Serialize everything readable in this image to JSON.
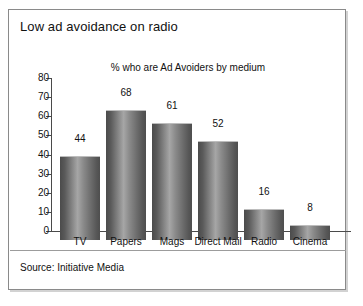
{
  "chart_data": {
    "type": "bar",
    "title": "Low ad avoidance on radio",
    "subtitle": "% who are Ad Avoiders by medium",
    "categories": [
      "TV",
      "Papers",
      "Mags",
      "Direct Mail",
      "Radio",
      "Cinema"
    ],
    "values": [
      44,
      68,
      61,
      52,
      16,
      8
    ],
    "xlabel": "",
    "ylabel": "",
    "ylim": [
      0,
      80
    ],
    "ytick_step": 10,
    "yticks": [
      0,
      10,
      20,
      30,
      40,
      50,
      60,
      70,
      80
    ],
    "ytick_labels": [
      "0",
      "10",
      "20",
      "30",
      "40",
      "50",
      "60",
      "70",
      "80"
    ],
    "data_labels": [
      "44",
      "68",
      "61",
      "52",
      "16",
      "8"
    ],
    "grid": false,
    "legend": false,
    "bar_color": "#7d7d7d",
    "source": "Source: Initiative Media"
  },
  "panel": {
    "title": "Low ad avoidance on radio",
    "subtitle": "% who are Ad Avoiders by medium",
    "source": "Source: Initiative Media"
  }
}
